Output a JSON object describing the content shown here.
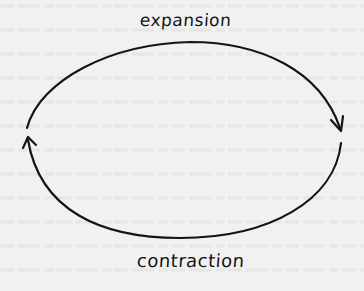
{
  "diagram": {
    "title": "",
    "labels": {
      "top": "expansion",
      "bottom": "contraction"
    },
    "shape": "ellipse-cycle",
    "arrows": [
      {
        "position": "right",
        "direction": "down"
      },
      {
        "position": "left",
        "direction": "up"
      }
    ],
    "colors": {
      "background": "#f1f1f1",
      "stroke": "#141414"
    }
  }
}
